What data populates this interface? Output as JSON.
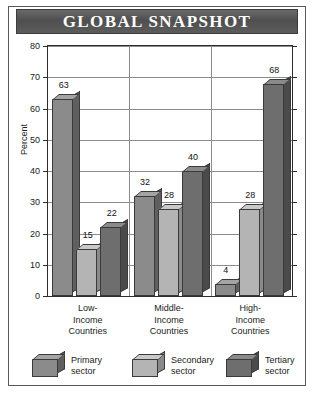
{
  "title": "GLOBAL SNAPSHOT",
  "colors": {
    "banner": "#585858",
    "banner_text": "#ffffff",
    "primary_sector": "#8b8b8b",
    "secondary_sector": "#b4b4b4",
    "tertiary_sector": "#6e6e6e",
    "axis": "#2d2d2d",
    "grid": "#8d8d8d",
    "background": "#ffffff"
  },
  "chart_data": {
    "type": "bar",
    "title": "GLOBAL SNAPSHOT",
    "subtitle": "",
    "xlabel": "",
    "ylabel": "Percent",
    "ylim": [
      0,
      80
    ],
    "yticks": [
      0,
      10,
      20,
      30,
      40,
      50,
      60,
      70,
      80
    ],
    "ytick_labels": [
      "0",
      "10",
      "20",
      "30",
      "40",
      "50",
      "60",
      "70",
      "80"
    ],
    "grid": "horizontal-and-group-separators",
    "legend_position": "bottom",
    "categories": [
      "Low-Income Countries",
      "Middle-Income Countries",
      "High-Income Countries"
    ],
    "category_lines": [
      [
        "Low-",
        "Income",
        "Countries"
      ],
      [
        "Middle-",
        "Income",
        "Countries"
      ],
      [
        "High-",
        "Income",
        "Countries"
      ]
    ],
    "series": [
      {
        "name": "Primary sector",
        "values": [
          63,
          32,
          4
        ]
      },
      {
        "name": "Secondary sector",
        "values": [
          15,
          28,
          28
        ]
      },
      {
        "name": "Tertiary sector",
        "values": [
          22,
          40,
          68
        ]
      }
    ],
    "data_labels": [
      [
        "63",
        "15",
        "22"
      ],
      [
        "32",
        "28",
        "40"
      ],
      [
        "4",
        "28",
        "68"
      ]
    ]
  },
  "legend": [
    {
      "line1": "Primary",
      "line2": "sector"
    },
    {
      "line1": "Secondary",
      "line2": "sector"
    },
    {
      "line1": "Tertiary",
      "line2": "sector"
    }
  ]
}
